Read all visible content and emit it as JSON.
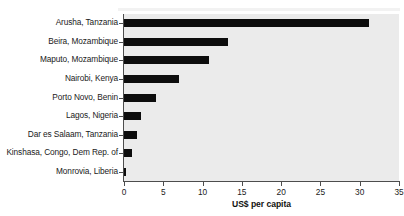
{
  "chart_data": {
    "type": "bar",
    "orientation": "horizontal",
    "title": "",
    "xlabel": "US$ per capita",
    "ylabel": "",
    "xlim": [
      0,
      35
    ],
    "xticks": [
      0,
      5,
      10,
      15,
      20,
      25,
      30,
      35
    ],
    "grid": false,
    "legend": null,
    "bar_color": "#0d0d0d",
    "plot_background": "#ebebeb",
    "categories": [
      "Arusha, Tanzania",
      "Beira, Mozambique",
      "Maputo, Mozambique",
      "Nairobi, Kenya",
      "Porto Novo, Benin",
      "Lagos, Nigeria",
      "Dar es Salaam, Tanzania",
      "Kinshasa, Congo, Dem Rep. of",
      "Monrovia, Liberia"
    ],
    "values": [
      31.2,
      13.2,
      10.8,
      7.0,
      4.1,
      2.2,
      1.6,
      1.0,
      0.2
    ]
  },
  "figure": {
    "axis_color": "#4d4d4d",
    "background": "#ffffff"
  }
}
